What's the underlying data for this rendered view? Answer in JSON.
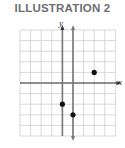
{
  "title": "ILLUSTRATION 2",
  "axes": {
    "x_label": "x",
    "y_label": "y"
  },
  "colors": {
    "grid": "#c8c8c8",
    "axis": "#333333",
    "line": "#777777",
    "point": "#111111",
    "title": "#6d6e71"
  },
  "chart_data": {
    "type": "scatter",
    "title": "ILLUSTRATION 2",
    "xlabel": "x",
    "ylabel": "y",
    "grid": true,
    "xlim": [
      -4,
      5
    ],
    "ylim": [
      -5,
      5
    ],
    "vertical_line": {
      "x": 1
    },
    "points": [
      {
        "x": 3,
        "y": 1
      },
      {
        "x": 0,
        "y": -2
      },
      {
        "x": 1,
        "y": -3
      }
    ]
  }
}
